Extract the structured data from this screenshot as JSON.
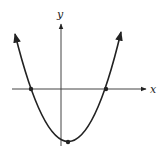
{
  "diagram": {
    "type": "parabola-graph",
    "axes": {
      "x_label": "x",
      "y_label": "y"
    },
    "curve": "upward-opening parabola",
    "marked_points": [
      {
        "name": "left-x-intercept"
      },
      {
        "name": "right-x-intercept"
      },
      {
        "name": "vertex"
      }
    ],
    "colors": {
      "line": "#222222",
      "background": "#ffffff"
    }
  }
}
